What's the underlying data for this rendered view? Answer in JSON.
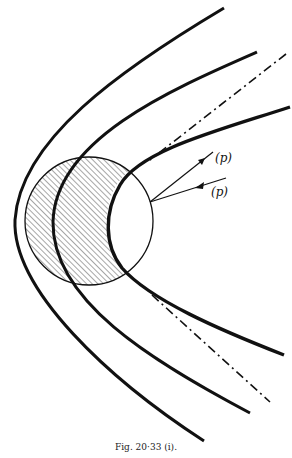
{
  "diagram": {
    "caption": "Fig. 20·33 (i).",
    "labels": {
      "outgoing": "(p)",
      "incoming": "(p)"
    },
    "elements": {
      "outer_curve": "outer hyperbolic trajectory",
      "middle_curve": "middle hyperbolic trajectory",
      "inner_curve": "inner thick trajectory grazing circle",
      "asymptote": "dash-dot asymptote",
      "circle": "scattering sphere (hatched region)",
      "arrows": "incoming and outgoing (p) rays"
    },
    "colors": {
      "ink": "#111111",
      "background": "#ffffff"
    }
  }
}
